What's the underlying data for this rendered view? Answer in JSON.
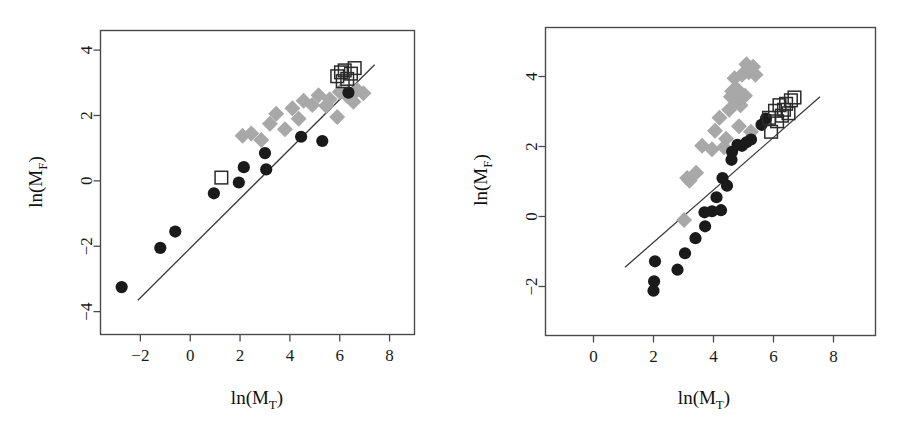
{
  "figure": {
    "background": "#ffffff",
    "panel_count": 2
  },
  "colors": {
    "circle_fill": "#1a1a1a",
    "diamond_fill": "#a8a8a8",
    "square_stroke": "#2b2b2b",
    "line_stroke": "#3a3a3a",
    "frame_stroke": "#4a4a4a",
    "text": "#111111"
  },
  "chart_data": [
    {
      "type": "scatter",
      "panel": "left",
      "title": "",
      "xlabel": "ln(M_T)",
      "ylabel": "ln(M_F)",
      "xlabel_parts": {
        "main": "ln(M",
        "sub": "T",
        "close": ")"
      },
      "ylabel_parts": {
        "main": "ln(M",
        "sub": "F",
        "close": ")"
      },
      "xlim": [
        -3.6,
        9.0
      ],
      "ylim": [
        -4.7,
        4.6
      ],
      "xticks": [
        -2,
        0,
        2,
        4,
        6,
        8
      ],
      "xticklabels": [
        "−2",
        "0",
        "2",
        "4",
        "6",
        "8"
      ],
      "yticks": [
        4,
        2,
        0,
        -2,
        -4
      ],
      "yticklabels": [
        "4",
        "2",
        "0",
        "−2",
        "−4"
      ],
      "grid": false,
      "legend": "none",
      "reference_line": {
        "name": "1:1 trend line",
        "x": [
          -2.1,
          7.4
        ],
        "y": [
          -3.65,
          3.55
        ]
      },
      "series": [
        {
          "name": "black filled circles",
          "marker": "circle",
          "color": "#1a1a1a",
          "points": [
            [
              -2.75,
              -3.25
            ],
            [
              -1.2,
              -2.05
            ],
            [
              -0.6,
              -1.55
            ],
            [
              0.95,
              -0.38
            ],
            [
              1.95,
              -0.05
            ],
            [
              2.15,
              0.42
            ],
            [
              3.0,
              0.85
            ],
            [
              3.05,
              0.35
            ],
            [
              4.45,
              1.35
            ],
            [
              5.3,
              1.22
            ],
            [
              6.35,
              2.7
            ]
          ]
        },
        {
          "name": "gray diamonds",
          "marker": "diamond",
          "color": "#a8a8a8",
          "points": [
            [
              2.1,
              1.38
            ],
            [
              2.45,
              1.45
            ],
            [
              2.85,
              1.25
            ],
            [
              3.2,
              1.75
            ],
            [
              3.45,
              2.05
            ],
            [
              3.8,
              1.58
            ],
            [
              4.1,
              2.22
            ],
            [
              4.35,
              1.9
            ],
            [
              4.55,
              2.45
            ],
            [
              4.9,
              2.32
            ],
            [
              5.15,
              2.62
            ],
            [
              5.45,
              2.3
            ],
            [
              5.6,
              2.5
            ],
            [
              5.9,
              1.95
            ],
            [
              6.0,
              2.72
            ],
            [
              6.3,
              2.6
            ],
            [
              6.55,
              2.42
            ],
            [
              6.7,
              2.78
            ],
            [
              6.95,
              2.68
            ]
          ]
        },
        {
          "name": "open squares",
          "marker": "square",
          "color": "#2b2b2b",
          "points": [
            [
              1.25,
              0.1
            ],
            [
              5.9,
              3.2
            ],
            [
              6.05,
              3.32
            ],
            [
              6.12,
              3.05
            ],
            [
              6.2,
              3.38
            ],
            [
              6.3,
              3.12
            ],
            [
              6.45,
              3.28
            ],
            [
              6.6,
              3.45
            ]
          ]
        }
      ]
    },
    {
      "type": "scatter",
      "panel": "right",
      "title": "",
      "xlabel": "ln(M_T)",
      "ylabel": "ln(M_F)",
      "xlabel_parts": {
        "main": "ln(M",
        "sub": "T",
        "close": ")"
      },
      "ylabel_parts": {
        "main": "ln(M",
        "sub": "F",
        "close": ")"
      },
      "xlim": [
        -1.6,
        9.4
      ],
      "ylim": [
        -3.4,
        5.4
      ],
      "xticks": [
        0,
        2,
        4,
        6,
        8
      ],
      "xticklabels": [
        "0",
        "2",
        "4",
        "6",
        "8"
      ],
      "yticks": [
        4,
        2,
        0,
        -2
      ],
      "yticklabels": [
        "4",
        "2",
        "0",
        "−2"
      ],
      "grid": false,
      "legend": "none",
      "reference_line": {
        "name": "1:1 trend line",
        "x": [
          1.05,
          7.55
        ],
        "y": [
          -1.45,
          3.42
        ]
      },
      "series": [
        {
          "name": "black filled circles",
          "marker": "circle",
          "color": "#1a1a1a",
          "points": [
            [
              2.0,
              -2.12
            ],
            [
              2.02,
              -1.85
            ],
            [
              2.05,
              -1.28
            ],
            [
              2.8,
              -1.52
            ],
            [
              3.05,
              -1.05
            ],
            [
              3.4,
              -0.62
            ],
            [
              3.7,
              0.12
            ],
            [
              3.72,
              -0.28
            ],
            [
              3.95,
              0.15
            ],
            [
              4.1,
              0.55
            ],
            [
              4.25,
              0.18
            ],
            [
              4.3,
              1.1
            ],
            [
              4.45,
              0.88
            ],
            [
              4.6,
              1.62
            ],
            [
              4.62,
              1.85
            ],
            [
              4.8,
              2.05
            ],
            [
              4.95,
              2.02
            ],
            [
              5.1,
              2.12
            ],
            [
              5.25,
              2.2
            ],
            [
              5.6,
              2.62
            ],
            [
              5.75,
              2.8
            ]
          ]
        },
        {
          "name": "gray diamonds",
          "marker": "diamond",
          "color": "#a8a8a8",
          "points": [
            [
              3.02,
              -0.1
            ],
            [
              3.12,
              1.1
            ],
            [
              3.2,
              1.02
            ],
            [
              3.42,
              1.25
            ],
            [
              3.62,
              2.02
            ],
            [
              3.95,
              1.92
            ],
            [
              4.05,
              2.45
            ],
            [
              4.2,
              2.82
            ],
            [
              4.35,
              1.98
            ],
            [
              4.42,
              2.22
            ],
            [
              4.52,
              3.05
            ],
            [
              4.58,
              3.42
            ],
            [
              4.62,
              3.58
            ],
            [
              4.7,
              3.95
            ],
            [
              4.75,
              3.3
            ],
            [
              4.8,
              3.62
            ],
            [
              4.85,
              2.58
            ],
            [
              4.9,
              3.18
            ],
            [
              4.95,
              4.05
            ],
            [
              5.05,
              3.45
            ],
            [
              5.1,
              4.35
            ],
            [
              5.18,
              4.12
            ],
            [
              5.25,
              2.42
            ],
            [
              5.32,
              4.28
            ],
            [
              5.4,
              4.05
            ]
          ]
        },
        {
          "name": "open squares",
          "marker": "square",
          "color": "#2b2b2b",
          "points": [
            [
              5.85,
              2.82
            ],
            [
              5.92,
              2.42
            ],
            [
              6.05,
              3.02
            ],
            [
              6.12,
              2.72
            ],
            [
              6.2,
              3.18
            ],
            [
              6.28,
              2.88
            ],
            [
              6.35,
              3.05
            ],
            [
              6.42,
              3.22
            ],
            [
              6.5,
              2.95
            ],
            [
              6.58,
              3.32
            ],
            [
              6.7,
              3.4
            ]
          ]
        }
      ]
    }
  ]
}
